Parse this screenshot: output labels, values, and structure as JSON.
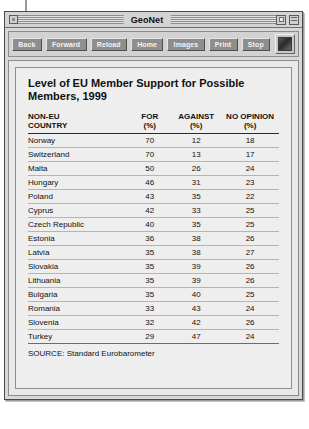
{
  "window": {
    "title": "GeoNet",
    "close_icon": "close-box-icon",
    "zoom_icon": "zoom-box-icon",
    "collapse_icon": "collapse-box-icon"
  },
  "toolbar": {
    "buttons": [
      {
        "label": "Back",
        "name": "back-button"
      },
      {
        "label": "Forward",
        "name": "forward-button"
      },
      {
        "label": "Reload",
        "name": "reload-button"
      },
      {
        "label": "Home",
        "name": "home-button"
      },
      {
        "label": "Images",
        "name": "images-button"
      },
      {
        "label": "Print",
        "name": "print-button"
      },
      {
        "label": "Stop",
        "name": "stop-button"
      }
    ],
    "logo_icon": "browser-logo-icon"
  },
  "page": {
    "headline": "Level of EU Member Support for Possible Members, 1999",
    "source": "SOURCE: Standard Eurobarometer"
  },
  "chart_data": {
    "type": "table",
    "title": "Level of EU Member Support for Possible Members, 1999",
    "columns": [
      "NON-EU\nCOUNTRY",
      "FOR\n(%)",
      "AGAINST\n(%)",
      "NO OPINION\n(%)"
    ],
    "categories": [
      "Norway",
      "Switzerland",
      "Malta",
      "Hungary",
      "Poland",
      "Cyprus",
      "Czech Republic",
      "Estonia",
      "Latvia",
      "Slovakia",
      "Lithuania",
      "Bulgaria",
      "Romania",
      "Slovenia",
      "Turkey"
    ],
    "series": [
      {
        "name": "FOR (%)",
        "values": [
          70,
          70,
          50,
          46,
          43,
          42,
          40,
          36,
          35,
          35,
          35,
          35,
          33,
          32,
          29
        ]
      },
      {
        "name": "AGAINST (%)",
        "values": [
          12,
          13,
          26,
          31,
          35,
          33,
          35,
          38,
          38,
          39,
          39,
          40,
          43,
          42,
          47
        ]
      },
      {
        "name": "NO OPINION (%)",
        "values": [
          18,
          17,
          24,
          23,
          22,
          25,
          25,
          26,
          27,
          26,
          26,
          25,
          24,
          26,
          24
        ]
      }
    ],
    "rows": [
      [
        "Norway",
        "70",
        "12",
        "18"
      ],
      [
        "Switzerland",
        "70",
        "13",
        "17"
      ],
      [
        "Malta",
        "50",
        "26",
        "24"
      ],
      [
        "Hungary",
        "46",
        "31",
        "23"
      ],
      [
        "Poland",
        "43",
        "35",
        "22"
      ],
      [
        "Cyprus",
        "42",
        "33",
        "25"
      ],
      [
        "Czech Republic",
        "40",
        "35",
        "25"
      ],
      [
        "Estonia",
        "36",
        "38",
        "26"
      ],
      [
        "Latvia",
        "35",
        "38",
        "27"
      ],
      [
        "Slovakia",
        "35",
        "39",
        "26"
      ],
      [
        "Lithuania",
        "35",
        "39",
        "26"
      ],
      [
        "Bulgaria",
        "35",
        "40",
        "25"
      ],
      [
        "Romania",
        "33",
        "43",
        "24"
      ],
      [
        "Slovenia",
        "32",
        "42",
        "26"
      ],
      [
        "Turkey",
        "29",
        "47",
        "24"
      ]
    ],
    "source": "SOURCE: Standard Eurobarometer",
    "xlabel": "",
    "ylabel": "Percent",
    "ylim": [
      0,
      100
    ]
  },
  "colors": {
    "window_chrome": "#d4d4d4",
    "toolbar_button": "#8e8e8e",
    "page_background": "#eeeeee",
    "text": "#111111",
    "rule": "#b4b4b4"
  }
}
